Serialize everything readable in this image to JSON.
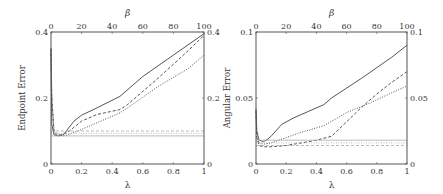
{
  "chart_data": [
    {
      "type": "line",
      "title": "",
      "xlabel": "λ",
      "x2label": "β",
      "ylabel": "Endpoint Error",
      "xlim": [
        0,
        1
      ],
      "x2lim": [
        0,
        100
      ],
      "ylim": [
        0,
        0.4
      ],
      "xticks": [
        "0",
        "0.2",
        "0.4",
        "0.6",
        "0.8",
        "1"
      ],
      "x2ticks": [
        "0",
        "20",
        "40",
        "60",
        "80",
        "100"
      ],
      "yticks": [
        "0",
        "0.2",
        "0.4"
      ],
      "y2ticks": [
        "0",
        "0.2",
        "0.4"
      ],
      "grid": false,
      "legend": "none",
      "series": [
        {
          "name": "solid",
          "style": "solid",
          "x": [
            0,
            0.005,
            0.02,
            0.05,
            0.08,
            0.1,
            0.15,
            0.2,
            0.3,
            0.45,
            0.6,
            0.8,
            1.0
          ],
          "y": [
            0.35,
            0.12,
            0.088,
            0.085,
            0.088,
            0.1,
            0.13,
            0.148,
            0.17,
            0.205,
            0.265,
            0.33,
            0.395
          ]
        },
        {
          "name": "dashed",
          "style": "dashed",
          "x": [
            0,
            0.005,
            0.02,
            0.04,
            0.06,
            0.08,
            0.12,
            0.2,
            0.3,
            0.45,
            0.5,
            0.7,
            0.9,
            1.0
          ],
          "y": [
            0.35,
            0.2,
            0.095,
            0.087,
            0.088,
            0.09,
            0.1,
            0.13,
            0.15,
            0.165,
            0.18,
            0.26,
            0.345,
            0.39
          ]
        },
        {
          "name": "dotted",
          "style": "dotted",
          "x": [
            0,
            0.005,
            0.02,
            0.05,
            0.08,
            0.12,
            0.2,
            0.3,
            0.45,
            0.5,
            0.7,
            0.9,
            1.0
          ],
          "y": [
            0.34,
            0.2,
            0.1,
            0.09,
            0.085,
            0.09,
            0.105,
            0.125,
            0.155,
            0.17,
            0.235,
            0.29,
            0.33
          ]
        },
        {
          "name": "baseline-solid",
          "style": "solid-light",
          "x": [
            0,
            1
          ],
          "y": [
            0.085,
            0.085
          ]
        },
        {
          "name": "baseline-dashed",
          "style": "dashed-light",
          "x": [
            0,
            1
          ],
          "y": [
            0.1,
            0.1
          ]
        },
        {
          "name": "baseline-dotted",
          "style": "dotted-light",
          "x": [
            0,
            1
          ],
          "y": [
            0.093,
            0.093
          ]
        }
      ]
    },
    {
      "type": "line",
      "title": "",
      "xlabel": "λ",
      "x2label": "β",
      "ylabel": "Angular Error",
      "xlim": [
        0,
        1
      ],
      "x2lim": [
        0,
        100
      ],
      "ylim": [
        0,
        0.1
      ],
      "xticks": [
        "0",
        "0.2",
        "0.4",
        "0.6",
        "0.8",
        "1"
      ],
      "x2ticks": [
        "0",
        "20",
        "40",
        "60",
        "80",
        "100"
      ],
      "yticks": [
        "0",
        "0.05",
        "0.1"
      ],
      "y2ticks": [
        "0",
        "0.05",
        "0.1"
      ],
      "grid": false,
      "legend": "none",
      "series": [
        {
          "name": "solid",
          "style": "solid",
          "x": [
            0,
            0.005,
            0.02,
            0.05,
            0.08,
            0.1,
            0.17,
            0.25,
            0.35,
            0.45,
            0.5,
            0.7,
            0.9,
            1.0
          ],
          "y": [
            0.042,
            0.025,
            0.018,
            0.017,
            0.019,
            0.021,
            0.03,
            0.035,
            0.04,
            0.045,
            0.05,
            0.065,
            0.081,
            0.09
          ]
        },
        {
          "name": "dashed",
          "style": "dashed",
          "x": [
            0,
            0.005,
            0.02,
            0.05,
            0.1,
            0.2,
            0.3,
            0.4,
            0.5,
            0.6,
            0.7,
            0.8,
            0.9,
            1.0
          ],
          "y": [
            0.04,
            0.02,
            0.014,
            0.013,
            0.013,
            0.014,
            0.016,
            0.018,
            0.021,
            0.032,
            0.043,
            0.053,
            0.062,
            0.07
          ]
        },
        {
          "name": "dotted",
          "style": "dotted",
          "x": [
            0,
            0.005,
            0.02,
            0.05,
            0.1,
            0.2,
            0.3,
            0.45,
            0.6,
            0.75,
            0.9,
            1.0
          ],
          "y": [
            0.04,
            0.02,
            0.016,
            0.015,
            0.016,
            0.02,
            0.024,
            0.029,
            0.039,
            0.046,
            0.054,
            0.059
          ]
        },
        {
          "name": "baseline-solid",
          "style": "solid-light",
          "x": [
            0,
            1
          ],
          "y": [
            0.018,
            0.018
          ]
        },
        {
          "name": "baseline-dashed",
          "style": "dashed-light",
          "x": [
            0,
            1
          ],
          "y": [
            0.014,
            0.014
          ]
        },
        {
          "name": "baseline-dotted",
          "style": "dotted-light",
          "x": [
            0,
            1
          ],
          "y": [
            0.016,
            0.016
          ]
        }
      ]
    }
  ],
  "colors": {
    "axis": "#555555",
    "line": "#555555",
    "baseline": "#aaaaaa",
    "text": "#333333"
  }
}
